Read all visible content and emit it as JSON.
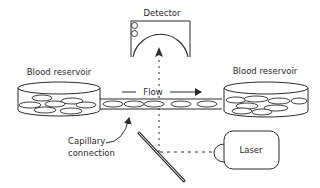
{
  "diagram": {
    "labels": {
      "detector": "Detector",
      "reservoir_left": "Blood reservoir",
      "reservoir_right": "Blood reservoir",
      "flow": "Flow",
      "capillary_line1": "Capillary",
      "capillary_line2": "connection",
      "laser": "Laser"
    },
    "colors": {
      "stroke": "#2a2a2a",
      "background": "#ffffff"
    }
  }
}
